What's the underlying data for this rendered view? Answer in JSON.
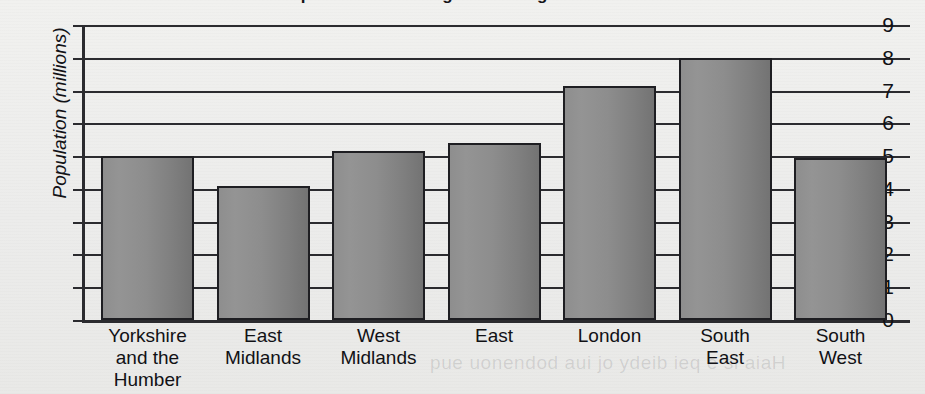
{
  "chart_data": {
    "type": "bar",
    "title": "Population of the regions of England in 2011",
    "xlabel": "",
    "ylabel": "Population (millions)",
    "categories": [
      "Yorkshire and the Humber",
      "East Midlands",
      "West Midlands",
      "East",
      "London",
      "South East",
      "South West"
    ],
    "category_lines": [
      [
        "Yorkshire",
        "and the",
        "Humber"
      ],
      [
        "East",
        "Midlands"
      ],
      [
        "West",
        "Midlands"
      ],
      [
        "East"
      ],
      [
        "London"
      ],
      [
        "South",
        "East"
      ],
      [
        "South",
        "West"
      ]
    ],
    "values": [
      5.0,
      4.1,
      5.15,
      5.4,
      7.15,
      8.0,
      4.93
    ],
    "ylim": [
      0,
      9
    ],
    "yticks": [
      0,
      1,
      2,
      3,
      4,
      5,
      6,
      7,
      8,
      9
    ],
    "ytick_labels": [
      "0",
      "1",
      "2",
      "3",
      "4",
      "5",
      "6",
      "7",
      "8",
      "9"
    ],
    "grid": true,
    "legend": false,
    "bar_color": "#8a8a8a",
    "bar_edge_color": "#1e1e22",
    "axis_color": "#2b2b2f",
    "background_color": "#efefed"
  },
  "artifacts": {
    "bleed_text": "pue uonendod aui jo ydeib ieq e si aiaH"
  }
}
